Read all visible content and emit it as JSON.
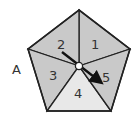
{
  "diagram": {
    "type": "pentagon-spinner",
    "outside_label": "A",
    "sectors": [
      {
        "label": "1",
        "fill": "#c9c9c9"
      },
      {
        "label": "2",
        "fill": "#c9c9c9"
      },
      {
        "label": "3",
        "fill": "#c9c9c9"
      },
      {
        "label": "4",
        "fill": "#e8e8e8"
      },
      {
        "label": "5",
        "fill": "#c9c9c9"
      }
    ],
    "arrow": {
      "points_to": "5"
    },
    "colors": {
      "stroke": "#222222",
      "arrow": "#111111",
      "hub": "#ffffff"
    }
  }
}
